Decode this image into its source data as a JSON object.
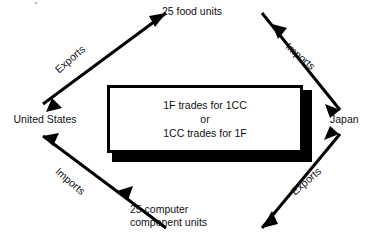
{
  "diagram": {
    "nodes": {
      "left": "United States",
      "right": "Japan",
      "top": "25 food units",
      "bottom_line1": "25 computer",
      "bottom_line2": "component units"
    },
    "flows": {
      "us_exports": "Exports",
      "japan_imports": "Imports",
      "japan_exports": "Exports",
      "us_imports": "Imports"
    },
    "center_box": {
      "line1": "1F trades for 1CC",
      "line2": "or",
      "line3": "1CC trades for 1F"
    },
    "colors": {
      "ink": "#000000",
      "background": "#ffffff"
    }
  }
}
